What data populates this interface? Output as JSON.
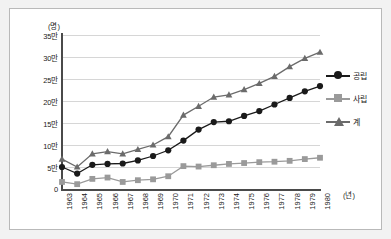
{
  "figure": {
    "y_unit_caption": "(명)",
    "x_unit_caption": "(년)"
  },
  "legend": {
    "items": [
      {
        "label": "공립",
        "marker": "circle-marker-icon",
        "color": "#1a1a1a"
      },
      {
        "label": "사립",
        "marker": "square-marker-icon",
        "color": "#9a9a9a"
      },
      {
        "label": "계",
        "marker": "triangle-marker-icon",
        "color": "#6b6b6b"
      }
    ]
  },
  "chart_data": {
    "type": "line",
    "title": "",
    "subtitle": "",
    "xlabel": "(년)",
    "ylabel": "(명)",
    "grid": true,
    "legend_position": "right",
    "x": [
      1963,
      1964,
      1965,
      1966,
      1967,
      1968,
      1969,
      1970,
      1971,
      1972,
      1973,
      1974,
      1975,
      1976,
      1977,
      1978,
      1979,
      1980
    ],
    "categories": [
      "1963",
      "1964",
      "1965",
      "1966",
      "1967",
      "1968",
      "1969",
      "1970",
      "1971",
      "1972",
      "1973",
      "1974",
      "1975",
      "1976",
      "1977",
      "1978",
      "1979",
      "1980"
    ],
    "xtick_labels": [
      "1963",
      "1964",
      "1965",
      "1966",
      "1967",
      "1968",
      "1969",
      "1970",
      "1971",
      "1972",
      "1973",
      "1974",
      "1975",
      "1976",
      "1977",
      "1978",
      "1979",
      "1980"
    ],
    "ytick_labels": [
      "0",
      "5만",
      "10만",
      "15만",
      "20만",
      "25만",
      "30만",
      "35만"
    ],
    "ytick_values": [
      0,
      50000,
      100000,
      150000,
      200000,
      250000,
      300000,
      350000
    ],
    "ylim": [
      0,
      350000
    ],
    "y_unit": "만",
    "series": [
      {
        "name": "공립",
        "marker": "circle",
        "color": "#1a1a1a",
        "values": [
          50000,
          35000,
          55000,
          57000,
          58000,
          65000,
          75000,
          88000,
          110000,
          135000,
          152000,
          154000,
          166000,
          177000,
          192000,
          207000,
          222000,
          234000
        ]
      },
      {
        "name": "사립",
        "marker": "square",
        "color": "#9a9a9a",
        "values": [
          16000,
          11000,
          23000,
          26000,
          16000,
          20000,
          22000,
          29000,
          52000,
          51000,
          54000,
          57000,
          59000,
          61000,
          62000,
          64000,
          68000,
          71000
        ]
      },
      {
        "name": "계",
        "marker": "triangle",
        "color": "#6b6b6b",
        "values": [
          68000,
          50000,
          80000,
          85000,
          80000,
          90000,
          100000,
          119000,
          168000,
          188000,
          209000,
          214000,
          226000,
          240000,
          256000,
          278000,
          297000,
          311000
        ]
      }
    ]
  }
}
